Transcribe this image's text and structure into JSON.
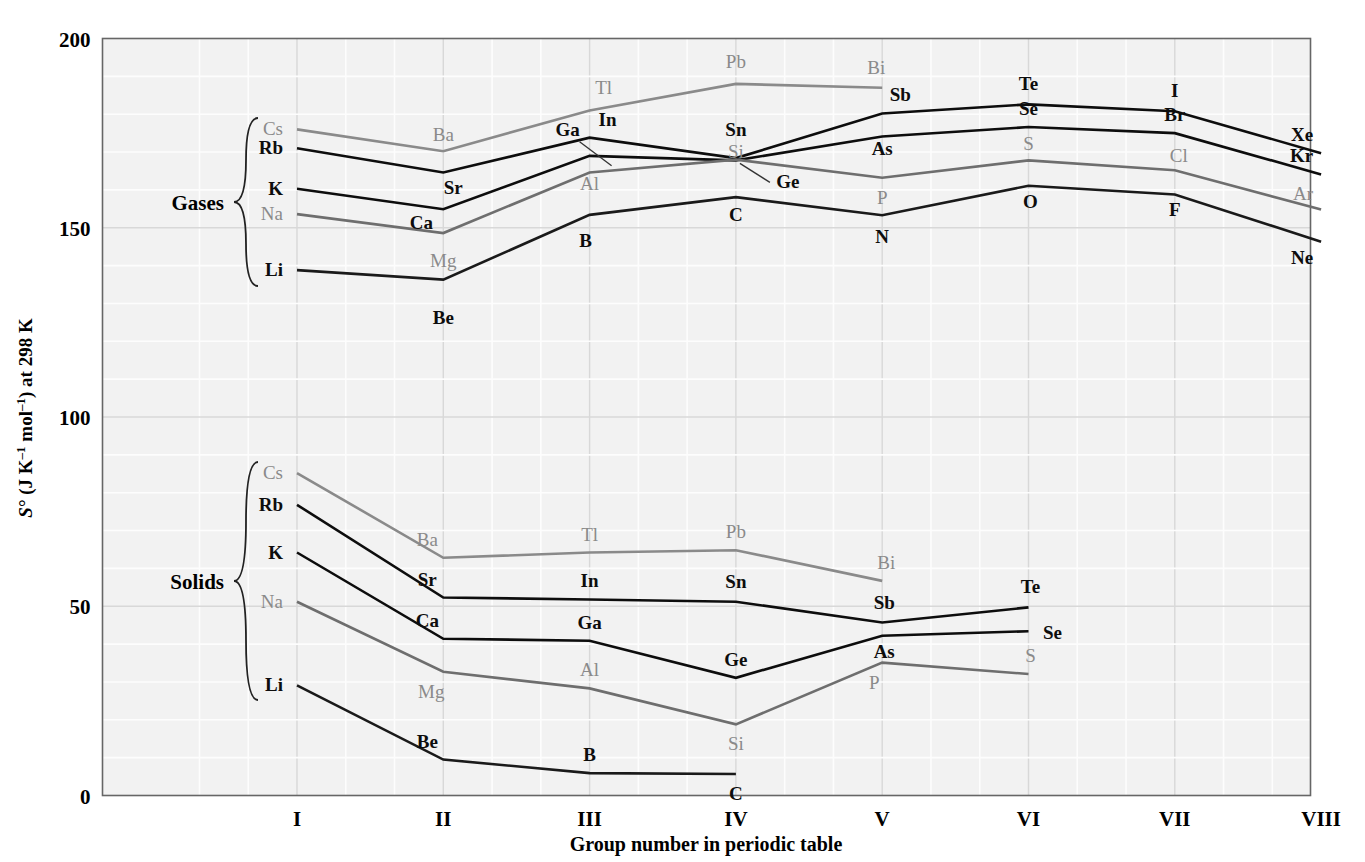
{
  "chart_data": {
    "type": "line",
    "title": "",
    "xlabel": "Group number in periodic table",
    "ylabel": "S° (J K⁻¹ mol⁻¹) at 298 K",
    "ylim": [
      0,
      200
    ],
    "yticks": [
      "0",
      "50",
      "100",
      "150",
      "200"
    ],
    "ytick_values": [
      0,
      50,
      100,
      150,
      200
    ],
    "categories": [
      "I",
      "II",
      "III",
      "IV",
      "V",
      "VI",
      "VII",
      "VIII"
    ],
    "grid": true,
    "legend_position": "inline-braces",
    "group_braces": [
      {
        "label": "Gases",
        "members": [
          "Cs",
          "Rb",
          "K",
          "Na",
          "Li"
        ]
      },
      {
        "label": "Solids",
        "members": [
          "Cs",
          "Rb",
          "K",
          "Na",
          "Li"
        ]
      }
    ],
    "series": [
      {
        "name": "Period 6 gases",
        "state": "gas",
        "color": "#8a8a8a",
        "points": [
          {
            "group": "I",
            "element": "Cs",
            "value": 176.0,
            "label_pos": "left"
          },
          {
            "group": "II",
            "element": "Ba",
            "value": 170.2,
            "label_pos": "above"
          },
          {
            "group": "III",
            "element": "Tl",
            "value": 181.0,
            "label_pos": "above"
          },
          {
            "group": "IV",
            "element": "Pb",
            "value": 188.0,
            "label_pos": "above"
          },
          {
            "group": "V",
            "element": "Bi",
            "value": 187.0,
            "label_pos": "above"
          }
        ]
      },
      {
        "name": "Period 5 gases",
        "state": "gas",
        "color": "#0d0d0d",
        "points": [
          {
            "group": "I",
            "element": "Rb",
            "value": 171.0,
            "label_pos": "left"
          },
          {
            "group": "II",
            "element": "Sr",
            "value": 164.6,
            "label_pos": "below"
          },
          {
            "group": "III",
            "element": "In",
            "value": 173.8,
            "label_pos": "right"
          },
          {
            "group": "IV",
            "element": "Sn",
            "value": 168.4,
            "label_pos": "above"
          },
          {
            "group": "V",
            "element": "Sb",
            "value": 180.2,
            "label_pos": "above"
          },
          {
            "group": "VI",
            "element": "Te",
            "value": 182.6,
            "label_pos": "above"
          },
          {
            "group": "VII",
            "element": "I",
            "value": 180.8,
            "label_pos": "above"
          },
          {
            "group": "VIII",
            "element": "Xe",
            "value": 169.7,
            "label_pos": "above"
          }
        ]
      },
      {
        "name": "Period 4 gases",
        "state": "gas",
        "color": "#0d0d0d",
        "points": [
          {
            "group": "I",
            "element": "K",
            "value": 160.3,
            "label_pos": "left"
          },
          {
            "group": "II",
            "element": "Ca",
            "value": 154.9,
            "label_pos": "below"
          },
          {
            "group": "III",
            "element": "Ga",
            "value": 169.0,
            "label_pos": "above"
          },
          {
            "group": "IV",
            "element": "Ge",
            "value": 167.8,
            "label_pos": "below-leader"
          },
          {
            "group": "V",
            "element": "As",
            "value": 174.1,
            "label_pos": "below"
          },
          {
            "group": "VI",
            "element": "Se",
            "value": 176.6,
            "label_pos": "above"
          },
          {
            "group": "VII",
            "element": "Br",
            "value": 175.0,
            "label_pos": "above"
          },
          {
            "group": "VIII",
            "element": "Kr",
            "value": 164.1,
            "label_pos": "above"
          }
        ]
      },
      {
        "name": "Period 3 gases",
        "state": "gas",
        "color": "#6e6e6e",
        "points": [
          {
            "group": "I",
            "element": "Na",
            "value": 153.6,
            "label_pos": "left"
          },
          {
            "group": "II",
            "element": "Mg",
            "value": 148.6,
            "label_pos": "below"
          },
          {
            "group": "III",
            "element": "Al",
            "value": 164.6,
            "label_pos": "above"
          },
          {
            "group": "IV",
            "element": "Si",
            "value": 168.0,
            "label_pos": "above"
          },
          {
            "group": "V",
            "element": "P",
            "value": 163.2,
            "label_pos": "below"
          },
          {
            "group": "VI",
            "element": "S",
            "value": 167.8,
            "label_pos": "above"
          },
          {
            "group": "VII",
            "element": "Cl",
            "value": 165.2,
            "label_pos": "above"
          },
          {
            "group": "VIII",
            "element": "Ar",
            "value": 154.8,
            "label_pos": "above"
          }
        ]
      },
      {
        "name": "Period 2 gases",
        "state": "gas",
        "color": "#1a1a1a",
        "points": [
          {
            "group": "I",
            "element": "Li",
            "value": 138.8,
            "label_pos": "left"
          },
          {
            "group": "II",
            "element": "Be",
            "value": 136.3,
            "label_pos": "below"
          },
          {
            "group": "III",
            "element": "B",
            "value": 153.4,
            "label_pos": "below"
          },
          {
            "group": "IV",
            "element": "C",
            "value": 158.1,
            "label_pos": "above"
          },
          {
            "group": "V",
            "element": "N",
            "value": 153.3,
            "label_pos": "below"
          },
          {
            "group": "VI",
            "element": "O",
            "value": 161.1,
            "label_pos": "below"
          },
          {
            "group": "VII",
            "element": "F",
            "value": 158.8,
            "label_pos": "below"
          },
          {
            "group": "VIII",
            "element": "Ne",
            "value": 146.3,
            "label_pos": "below"
          }
        ]
      },
      {
        "name": "Period 6 solids",
        "state": "solid",
        "color": "#8a8a8a",
        "points": [
          {
            "group": "I",
            "element": "Cs",
            "value": 85.2,
            "label_pos": "left"
          },
          {
            "group": "II",
            "element": "Ba",
            "value": 62.8,
            "label_pos": "above"
          },
          {
            "group": "III",
            "element": "Tl",
            "value": 64.2,
            "label_pos": "above"
          },
          {
            "group": "IV",
            "element": "Pb",
            "value": 64.8,
            "label_pos": "above"
          },
          {
            "group": "V",
            "element": "Bi",
            "value": 56.7,
            "label_pos": "above"
          }
        ]
      },
      {
        "name": "Period 5 solids",
        "state": "solid",
        "color": "#0d0d0d",
        "points": [
          {
            "group": "I",
            "element": "Rb",
            "value": 76.8,
            "label_pos": "left"
          },
          {
            "group": "II",
            "element": "Sr",
            "value": 52.3,
            "label_pos": "above"
          },
          {
            "group": "III",
            "element": "In",
            "value": 51.8,
            "label_pos": "above"
          },
          {
            "group": "IV",
            "element": "Sn",
            "value": 51.2,
            "label_pos": "above"
          },
          {
            "group": "V",
            "element": "Sb",
            "value": 45.7,
            "label_pos": "above"
          },
          {
            "group": "VI",
            "element": "Te",
            "value": 49.7,
            "label_pos": "above"
          }
        ]
      },
      {
        "name": "Period 4 solids",
        "state": "solid",
        "color": "#0d0d0d",
        "points": [
          {
            "group": "I",
            "element": "K",
            "value": 64.2,
            "label_pos": "left"
          },
          {
            "group": "II",
            "element": "Ca",
            "value": 41.4,
            "label_pos": "above"
          },
          {
            "group": "III",
            "element": "Ga",
            "value": 40.9,
            "label_pos": "above"
          },
          {
            "group": "IV",
            "element": "Ge",
            "value": 31.1,
            "label_pos": "above"
          },
          {
            "group": "V",
            "element": "As",
            "value": 42.2,
            "label_pos": "above"
          },
          {
            "group": "VI",
            "element": "Se",
            "value": 43.4,
            "label_pos": "right"
          }
        ]
      },
      {
        "name": "Period 3 solids",
        "state": "solid",
        "color": "#6e6e6e",
        "points": [
          {
            "group": "I",
            "element": "Na",
            "value": 51.2,
            "label_pos": "left"
          },
          {
            "group": "II",
            "element": "Mg",
            "value": 32.7,
            "label_pos": "below"
          },
          {
            "group": "III",
            "element": "Al",
            "value": 28.3,
            "label_pos": "above"
          },
          {
            "group": "IV",
            "element": "Si",
            "value": 18.8,
            "label_pos": "below"
          },
          {
            "group": "V",
            "element": "P",
            "value": 35.1,
            "label_pos": "below"
          },
          {
            "group": "VI",
            "element": "S",
            "value": 32.1,
            "label_pos": "above"
          }
        ]
      },
      {
        "name": "Period 2 solids",
        "state": "solid",
        "color": "#1a1a1a",
        "points": [
          {
            "group": "I",
            "element": "Li",
            "value": 29.1,
            "label_pos": "left"
          },
          {
            "group": "II",
            "element": "Be",
            "value": 9.5,
            "label_pos": "above"
          },
          {
            "group": "III",
            "element": "B",
            "value": 5.9,
            "label_pos": "above"
          },
          {
            "group": "IV",
            "element": "C",
            "value": 5.7,
            "label_pos": "above"
          }
        ]
      }
    ]
  },
  "axis": {
    "y_title": "S° (J K⁻¹ mol⁻¹) at 298 K",
    "x_title": "Group number in periodic table",
    "y_ticks": [
      "200",
      "150",
      "100",
      "50",
      "0"
    ],
    "x_ticks": [
      "I",
      "II",
      "III",
      "IV",
      "V",
      "VI",
      "VII",
      "VIII"
    ]
  },
  "braces": {
    "gases_label": "Gases",
    "solids_label": "Solids"
  },
  "colors": {
    "plot_bg": "#f2f2f2",
    "grid_minor": "#ffffff",
    "grid_major": "#e0e0e0",
    "axis": "#555555",
    "dark_line": "#111111",
    "gray_line": "#8a8a8a",
    "mid_gray_line": "#6e6e6e"
  }
}
